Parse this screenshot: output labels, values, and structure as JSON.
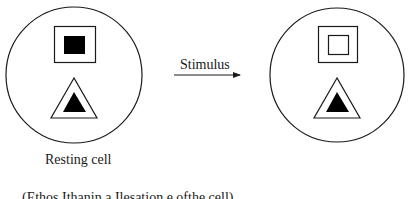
{
  "diagram": {
    "type": "cell-state-transition",
    "arrow_label": "Stimulus",
    "left_cell_label": "Resting cell",
    "caption_partial": "(Ethos Ithanin a Ilesation e ofthe cell)",
    "stroke_color": "#1a1a1a",
    "fill_color": "#000000",
    "background": "#ffffff",
    "cells": [
      {
        "name": "resting-cell",
        "label": "Resting cell",
        "square_inner": "filled",
        "triangle_inner": "filled"
      },
      {
        "name": "stimulated-cell",
        "label": "",
        "square_inner": "hollow",
        "triangle_inner": "filled"
      }
    ]
  }
}
